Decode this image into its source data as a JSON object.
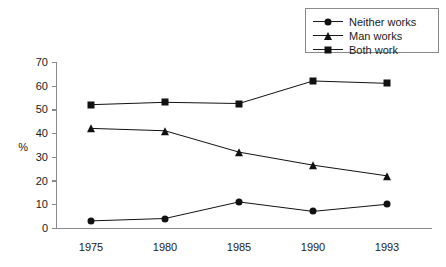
{
  "chart_data": {
    "type": "line",
    "title": "",
    "xlabel": "",
    "ylabel": "%",
    "categories": [
      "1975",
      "1980",
      "1985",
      "1990",
      "1993"
    ],
    "xtick_labels": [
      "1975",
      "1980",
      "1985",
      "1990",
      "1993"
    ],
    "ytick_labels": [
      "0",
      "10",
      "20",
      "30",
      "40",
      "50",
      "60",
      "70"
    ],
    "ytick_values": [
      0,
      10,
      20,
      30,
      40,
      50,
      60,
      70
    ],
    "ylim": [
      0,
      70
    ],
    "grid": false,
    "legend_position": "top-right",
    "series": [
      {
        "name": "Neither works",
        "marker": "circle",
        "color": "#111111",
        "values": [
          3,
          4,
          11,
          7,
          10
        ]
      },
      {
        "name": "Man works",
        "marker": "triangle",
        "color": "#111111",
        "values": [
          42,
          41,
          32,
          26.5,
          22
        ]
      },
      {
        "name": "Both work",
        "marker": "square",
        "color": "#111111",
        "values": [
          52,
          53,
          52.5,
          62,
          61
        ]
      }
    ]
  },
  "legend": {
    "items": [
      {
        "label": "Neither works",
        "marker": "circle"
      },
      {
        "label": "Man works",
        "marker": "triangle"
      },
      {
        "label": "Both work",
        "marker": "square"
      }
    ]
  },
  "axes": {
    "y_label": "%",
    "y_ticks": [
      "70",
      "60",
      "50",
      "40",
      "30",
      "20",
      "10",
      "0"
    ],
    "x_ticks": [
      "1975",
      "1980",
      "1985",
      "1990",
      "1993"
    ]
  },
  "colors": {
    "ink": "#111111",
    "axis": "#8a8a8a",
    "background": "#ffffff"
  }
}
